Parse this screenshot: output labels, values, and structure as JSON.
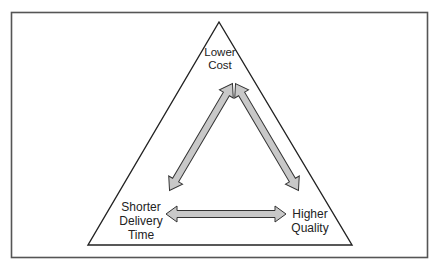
{
  "diagram": {
    "type": "trade-off triangle",
    "nodes": {
      "top": {
        "lines": [
          "Lower",
          "Cost"
        ]
      },
      "bottom_left": {
        "lines": [
          "Shorter",
          "Delivery",
          "Time"
        ]
      },
      "bottom_right": {
        "lines": [
          "Higher",
          "Quality"
        ]
      }
    },
    "arrows": [
      {
        "from": "top",
        "to": "bottom_left",
        "bidirectional": true
      },
      {
        "from": "top",
        "to": "bottom_right",
        "bidirectional": true
      },
      {
        "from": "bottom_left",
        "to": "bottom_right",
        "bidirectional": true
      }
    ],
    "colors": {
      "frame": "#555555",
      "triangle": "#222222",
      "arrow_fill": "#c8c8c8",
      "arrow_stroke": "#333333"
    }
  }
}
